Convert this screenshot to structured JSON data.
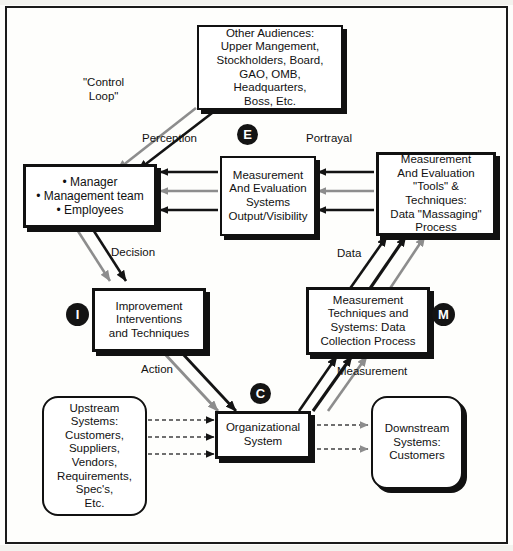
{
  "diagram": {
    "colors": {
      "ink": "#111111",
      "paper": "#fefefc",
      "arrow_dark": "#141414",
      "arrow_gray": "#8d8d8d",
      "marker_fill": "#141414",
      "marker_text": "#ffffff"
    },
    "nodes": [
      {
        "id": "other-audiences",
        "label": "Other Audiences:\nUpper Mangement,\nStockholders, Board,\nGAO, OMB, Headquarters,\nBoss, Etc.",
        "shape": "rect-shadow"
      },
      {
        "id": "manager",
        "label": "• Manager\n• Management team\n• Employees",
        "shape": "rect-shadow"
      },
      {
        "id": "measurement-evaluation-systems",
        "label": "Measurement\nAnd Evaluation\nSystems\nOutput/Visibility",
        "shape": "rect-shadow"
      },
      {
        "id": "measurement-evaluation-tools",
        "label": "Measurement\nAnd Evaluation\n\"Tools\" & Techniques:\nData \"Massaging\"\nProcess",
        "shape": "rect-shadow"
      },
      {
        "id": "improvement-interventions",
        "label": "Improvement\nInterventions\nand Techniques",
        "shape": "rect-shadow"
      },
      {
        "id": "measurement-techniques",
        "label": "Measurement\nTechniques and\nSystems: Data\nCollection Process",
        "shape": "rect-shadow"
      },
      {
        "id": "upstream-systems",
        "label": "Upstream\nSystems:\nCustomers,\nSuppliers,\nVendors,\nRequirements,\nSpec's,\nEtc.",
        "shape": "rounded"
      },
      {
        "id": "organizational-system",
        "label": "Organizational\nSystem",
        "shape": "rect-shadow"
      },
      {
        "id": "downstream-systems",
        "label": "Downstream\nSystems:\nCustomers",
        "shape": "rounded-shadow"
      }
    ],
    "edge_labels": [
      {
        "id": "control-loop",
        "text": "\"Control\nLoop\""
      },
      {
        "id": "perception",
        "text": "Perception"
      },
      {
        "id": "portrayal",
        "text": "Portrayal"
      },
      {
        "id": "decision",
        "text": "Decision"
      },
      {
        "id": "data",
        "text": "Data"
      },
      {
        "id": "action",
        "text": "Action"
      },
      {
        "id": "measurement",
        "text": "Measurement"
      }
    ],
    "markers": [
      {
        "id": "marker-e",
        "letter": "E"
      },
      {
        "id": "marker-i",
        "letter": "I"
      },
      {
        "id": "marker-m",
        "letter": "M"
      },
      {
        "id": "marker-c",
        "letter": "C"
      }
    ]
  }
}
